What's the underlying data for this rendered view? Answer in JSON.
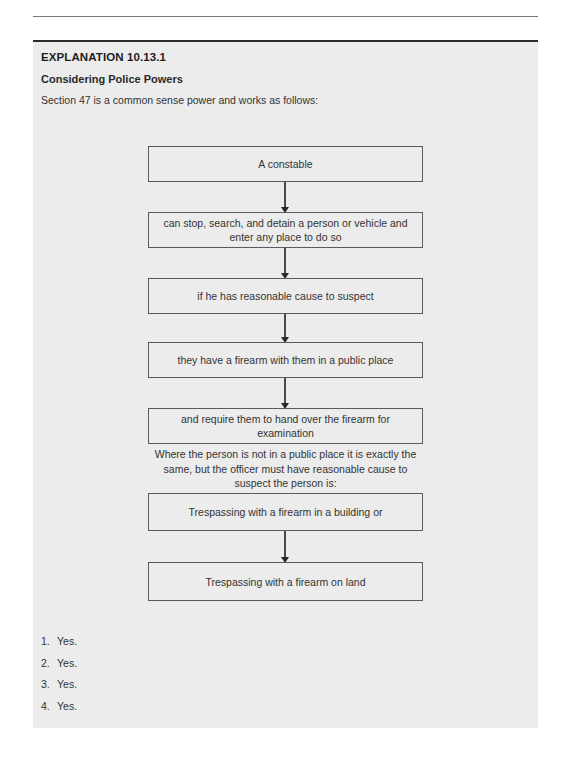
{
  "page": {
    "running_head_fragment": "Answers to Chapter 10"
  },
  "explanation": {
    "label": "EXPLANATION 10.13.1",
    "title": "Considering Police Powers",
    "intro": "Section 47 is a common sense power and works as follows:"
  },
  "flowchart": {
    "steps": [
      {
        "text": "A constable"
      },
      {
        "text": "can stop, search, and detain a person or vehicle and enter any place to do so"
      },
      {
        "text": "if he has reasonable cause to suspect"
      },
      {
        "text": "they have a firearm with them in a public place"
      },
      {
        "text": "and require them to hand over the firearm for examination"
      }
    ],
    "note": "Where the person is not in a public place it is exactly the same, but the officer must have reasonable cause to suspect the person is:",
    "alternatives": [
      {
        "text": "Trespassing with a firearm in a building or"
      },
      {
        "text": "Trespassing with a firearm on land"
      }
    ]
  },
  "answers": [
    {
      "num": "1.",
      "text": "Yes."
    },
    {
      "num": "2.",
      "text": "Yes."
    },
    {
      "num": "3.",
      "text": "Yes."
    },
    {
      "num": "4.",
      "text": "Yes."
    }
  ]
}
